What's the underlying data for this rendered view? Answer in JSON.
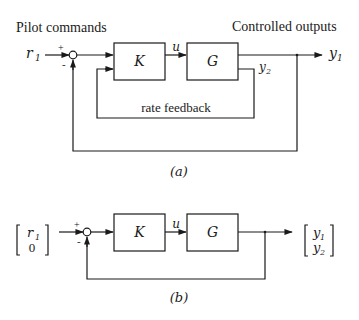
{
  "diagram_a": {
    "caption": "(a)",
    "title_left": "Pilot commands",
    "title_right": "Controlled outputs",
    "input_label": "r",
    "input_sub": "1",
    "plus_sign": "+",
    "minus_sign": "-",
    "controller_label": "K",
    "plant_label": "G",
    "signal_u": "u",
    "output_y1": "y",
    "output_y1_sub": "1",
    "output_y2": "y",
    "output_y2_sub": "2",
    "feedback_label": "rate feedback"
  },
  "diagram_b": {
    "caption": "(b)",
    "input_vector": [
      "r",
      "0"
    ],
    "input_vector_sub": [
      "1",
      ""
    ],
    "plus_sign": "+",
    "minus_sign": "-",
    "controller_label": "K",
    "plant_label": "G",
    "signal_u": "u",
    "output_vector": [
      "y",
      "y"
    ],
    "output_vector_sub": [
      "1",
      "2"
    ]
  },
  "colors": {
    "ink": "#1a1a1a",
    "background": "#ffffff"
  }
}
